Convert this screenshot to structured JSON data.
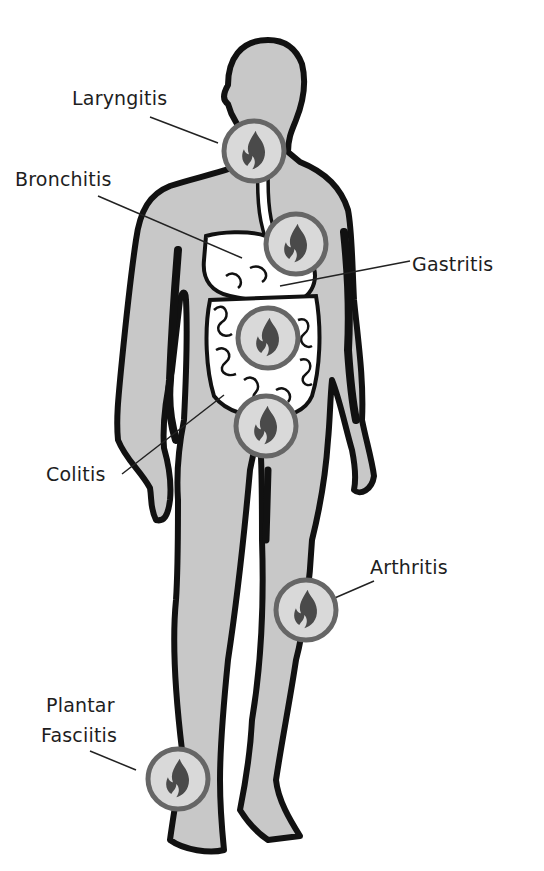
{
  "diagram": {
    "type": "anatomical-inflammation-map",
    "colors": {
      "body_fill": "#c8c8c8",
      "outline": "#111111",
      "organ_fill": "#ffffff",
      "marker_ring": "#666666",
      "marker_fill": "#d9d9d9",
      "flame": "#4a4a4a",
      "leader_line": "#222222",
      "label_text": "#1e1e1e"
    },
    "markers": [
      {
        "id": "laryngitis",
        "label": "Laryngitis",
        "location": "throat"
      },
      {
        "id": "bronchitis",
        "label": "Bronchitis",
        "location": "bronchi"
      },
      {
        "id": "gastritis",
        "label": "Gastritis",
        "location": "stomach"
      },
      {
        "id": "colitis",
        "label": "Colitis",
        "location": "colon"
      },
      {
        "id": "arthritis",
        "label": "Arthritis",
        "location": "knee"
      },
      {
        "id": "plantar_fasciitis",
        "label_line1": "Plantar",
        "label_line2": "Fasciitis",
        "location": "ankle/foot"
      }
    ],
    "icon": "flame-icon"
  }
}
